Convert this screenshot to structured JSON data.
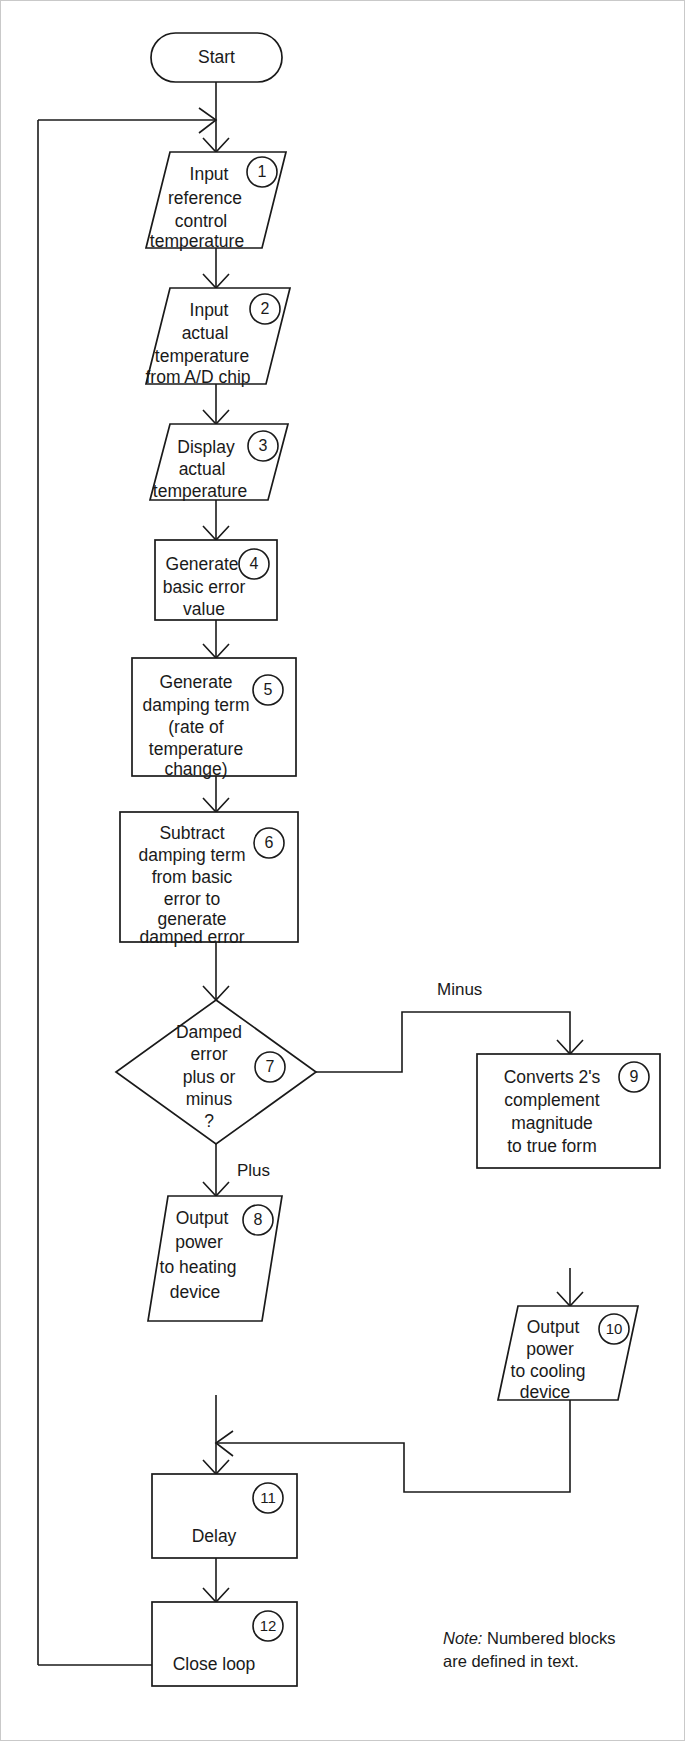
{
  "diagram": {
    "note": {
      "label": "Note:",
      "text": " Numbered blocks",
      "line2": "are defined in text."
    },
    "colors": {
      "stroke": "#1a1a1a",
      "fill": "#ffffff",
      "frame": "#c9c9c9"
    },
    "nodes": [
      {
        "id": "start",
        "shape": "terminator",
        "badge": "",
        "lines": [
          "Start"
        ]
      },
      {
        "id": "block-1",
        "shape": "parallelogram",
        "badge": "1",
        "lines": [
          "Input",
          "reference",
          "control",
          "temperature"
        ]
      },
      {
        "id": "block-2",
        "shape": "parallelogram",
        "badge": "2",
        "lines": [
          "Input",
          "actual",
          "temperature",
          "from A/D chip"
        ]
      },
      {
        "id": "block-3",
        "shape": "parallelogram",
        "badge": "3",
        "lines": [
          "Display",
          "actual",
          "temperature"
        ]
      },
      {
        "id": "block-4",
        "shape": "rectangle",
        "badge": "4",
        "lines": [
          "Generate",
          "basic error",
          "value"
        ]
      },
      {
        "id": "block-5",
        "shape": "rectangle",
        "badge": "5",
        "lines": [
          "Generate",
          "damping term",
          "(rate of",
          "temperature",
          "change)"
        ]
      },
      {
        "id": "block-6",
        "shape": "rectangle",
        "badge": "6",
        "lines": [
          "Subtract",
          "damping term",
          "from basic",
          "error to",
          "generate",
          "damped error"
        ]
      },
      {
        "id": "block-7",
        "shape": "diamond",
        "badge": "7",
        "lines": [
          "Damped",
          "error",
          "plus or",
          "minus",
          "?"
        ]
      },
      {
        "id": "block-8",
        "shape": "parallelogram",
        "badge": "8",
        "lines": [
          "Output",
          "power",
          "to heating",
          "device"
        ]
      },
      {
        "id": "block-9",
        "shape": "rectangle",
        "badge": "9",
        "lines": [
          "Converts 2's",
          "complement",
          "magnitude",
          "to true form"
        ]
      },
      {
        "id": "block-10",
        "shape": "parallelogram",
        "badge": "10",
        "lines": [
          "Output",
          "power",
          "to cooling",
          "device"
        ]
      },
      {
        "id": "block-11",
        "shape": "rectangle",
        "badge": "11",
        "lines": [
          "Delay"
        ]
      },
      {
        "id": "block-12",
        "shape": "rectangle",
        "badge": "12",
        "lines": [
          "Close loop"
        ]
      }
    ],
    "edge_labels": [
      {
        "id": "label-minus",
        "text": "Minus"
      },
      {
        "id": "label-plus",
        "text": "Plus"
      }
    ]
  }
}
